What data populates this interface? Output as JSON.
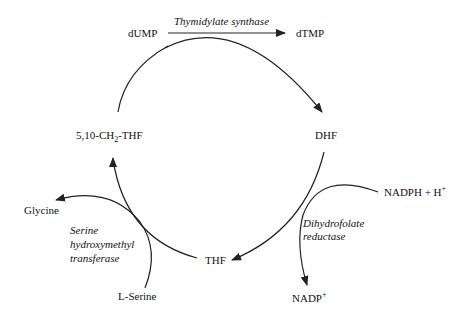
{
  "diagram": {
    "nodes": {
      "dump": "dUMP",
      "dtmp": "dTMP",
      "dhf": "DHF",
      "thf": "THF",
      "methylene_thf_prefix": "5,10-CH",
      "methylene_thf_sub": "2",
      "methylene_thf_suffix": "-THF",
      "nadph_prefix": "NADPH + H",
      "nadph_sup": "+",
      "nadp_prefix": "NADP",
      "nadp_sup": "+",
      "glycine": "Glycine",
      "serine": "L-Serine"
    },
    "enzymes": {
      "thymidylate_synthase": "Thymidylate synthase",
      "dhfr_line1": "Dihydrofolate",
      "dhfr_line2": "reductase",
      "shmt_line1": "Serine",
      "shmt_line2": "hydroxymethyl",
      "shmt_line3": "transferase"
    },
    "colors": {
      "line": "#222222",
      "text": "#111111",
      "background": "#ffffff"
    }
  }
}
